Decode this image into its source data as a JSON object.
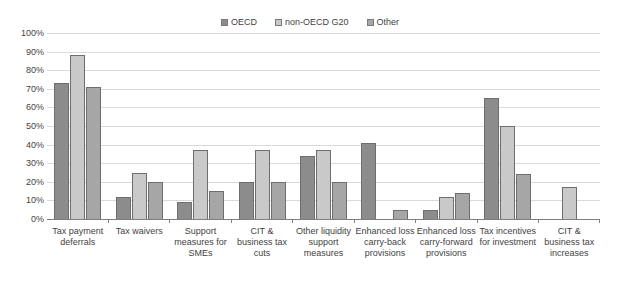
{
  "legend": {
    "position": "top-center",
    "entries": [
      {
        "label": "OECD",
        "color": "#8c8c8c"
      },
      {
        "label": "non-OECD G20",
        "color": "#c9c9c9"
      },
      {
        "label": "Other",
        "color": "#a6a6a6"
      }
    ]
  },
  "axis": {
    "yticks": [
      "0%",
      "10%",
      "20%",
      "30%",
      "40%",
      "50%",
      "60%",
      "70%",
      "80%",
      "90%",
      "100%"
    ]
  },
  "chart_data": {
    "type": "bar",
    "title": "",
    "subtitle": "",
    "xlabel": "",
    "ylabel": "",
    "ylim": [
      0,
      100
    ],
    "ytick_step": 10,
    "grid": true,
    "legend_position": "top-center",
    "value_unit": "percent",
    "categories": [
      "Tax payment deferrals",
      "Tax waivers",
      "Support measures for SMEs",
      "CIT & business tax cuts",
      "Other liquidity support measures",
      "Enhanced loss carry-back provisions",
      "Enhanced loss carry-forward provisions",
      "Tax incentives for investment",
      "CIT & business tax increases"
    ],
    "series": [
      {
        "name": "OECD",
        "color": "#8c8c8c",
        "values": [
          73,
          12,
          9,
          20,
          34,
          41,
          5,
          65,
          0
        ]
      },
      {
        "name": "non-OECD G20",
        "color": "#c9c9c9",
        "values": [
          88,
          25,
          37,
          37,
          37,
          0,
          12,
          50,
          17
        ]
      },
      {
        "name": "Other",
        "color": "#a6a6a6",
        "values": [
          71,
          20,
          15,
          20,
          20,
          5,
          14,
          24,
          0
        ]
      }
    ]
  }
}
